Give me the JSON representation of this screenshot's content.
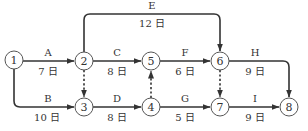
{
  "diagram": {
    "type": "arrow-network",
    "nodes": [
      {
        "id": "1",
        "label": "1",
        "x": 14,
        "y": 60
      },
      {
        "id": "2",
        "label": "2",
        "x": 84,
        "y": 61
      },
      {
        "id": "3",
        "label": "3",
        "x": 84,
        "y": 107
      },
      {
        "id": "4",
        "label": "4",
        "x": 151,
        "y": 107
      },
      {
        "id": "5",
        "label": "5",
        "x": 151,
        "y": 61
      },
      {
        "id": "6",
        "label": "6",
        "x": 220,
        "y": 61
      },
      {
        "id": "7",
        "label": "7",
        "x": 220,
        "y": 107
      },
      {
        "id": "8",
        "label": "8",
        "x": 289,
        "y": 107
      }
    ],
    "activities": [
      {
        "name": "A",
        "duration": "7 日",
        "from": "1",
        "to": "2"
      },
      {
        "name": "B",
        "duration": "10 日",
        "from": "1",
        "to": "3"
      },
      {
        "name": "C",
        "duration": "8 日",
        "from": "2",
        "to": "5"
      },
      {
        "name": "D",
        "duration": "8 日",
        "from": "3",
        "to": "4"
      },
      {
        "name": "E",
        "duration": "12 日",
        "from": "2",
        "to": "6"
      },
      {
        "name": "F",
        "duration": "6 日",
        "from": "5",
        "to": "6"
      },
      {
        "name": "G",
        "duration": "5 日",
        "from": "4",
        "to": "7"
      },
      {
        "name": "H",
        "duration": "9 日",
        "from": "6",
        "to": "8"
      },
      {
        "name": "I",
        "duration": "9 日",
        "from": "7",
        "to": "8"
      }
    ],
    "dummies": [
      {
        "from": "2",
        "to": "3"
      },
      {
        "from": "4",
        "to": "5"
      },
      {
        "from": "6",
        "to": "7"
      }
    ]
  }
}
